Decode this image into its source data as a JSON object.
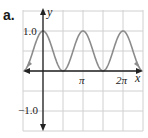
{
  "panel_label": "a.",
  "chart_data": {
    "type": "line",
    "title": "",
    "function": "y = cos^2(x)",
    "xlabel": "x",
    "ylabel": "y",
    "x_tick_labels": [
      "π",
      "2π"
    ],
    "x_tick_values": [
      3.14159,
      6.28319
    ],
    "y_tick_labels": [
      "1.0",
      "-1.0"
    ],
    "y_tick_values": [
      1.0,
      -1.0
    ],
    "xlim": [
      -1.57,
      7.85
    ],
    "ylim": [
      -1.5,
      1.5
    ],
    "grid": true,
    "grid_spacing": {
      "x": "π/2",
      "y": 0.5
    },
    "series": [
      {
        "name": "cos^2(x)",
        "color": "#8c8c8c",
        "x": [
          -1.57,
          -0.785,
          0,
          0.785,
          1.571,
          2.356,
          3.142,
          3.927,
          4.712,
          5.498,
          6.283,
          7.069,
          7.854
        ],
        "y": [
          0,
          0.5,
          1.0,
          0.5,
          0,
          0.5,
          1.0,
          0.5,
          0,
          0.5,
          1.0,
          0.5,
          0
        ]
      }
    ],
    "axis_color": "#222222",
    "grid_color": "#d0d0d0"
  }
}
